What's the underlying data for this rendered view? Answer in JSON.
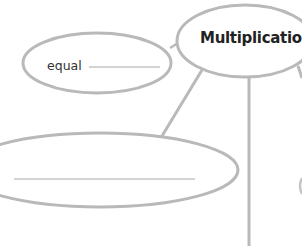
{
  "diagram": {
    "type": "concept-map",
    "center_node": {
      "label": "Multiplication"
    },
    "nodes": [
      {
        "id": "equal",
        "label": "equal",
        "has_blank": true
      },
      {
        "id": "lower-left",
        "label": "",
        "has_blank": true
      },
      {
        "id": "right-partial",
        "label": "",
        "has_blank": false
      }
    ],
    "colors": {
      "stroke": "#b9b9b9",
      "text": "#2b2b2b",
      "background": "#ffffff"
    }
  }
}
